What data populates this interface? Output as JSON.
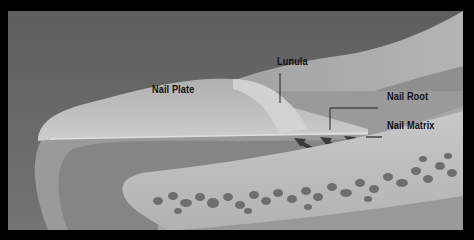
{
  "diagram": {
    "labels": {
      "nail_plate": "Nail Plate",
      "lunula": "Lunula",
      "nail_root": "Nail Root",
      "nail_matrix": "Nail Matrix"
    },
    "colors": {
      "frame": "#000000",
      "background": "#6a6a6a",
      "skin_upper": "#a8a8a8",
      "nail_plate": "#c4c4c4",
      "lunula": "#d2d2d2",
      "dermis": "#8a8a8a",
      "bone": "#bdbdbd",
      "bone_pores": "#6e6e6e",
      "label_text": "#111111"
    }
  }
}
